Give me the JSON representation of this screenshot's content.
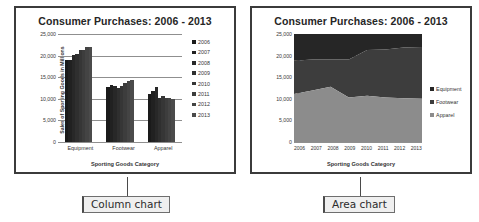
{
  "charts": [
    {
      "id": "column",
      "title": "Consumer Purchases: 2006 - 2013",
      "callout": "Column chart",
      "ylabel": "Sales of Sporting Goods  in Millions",
      "xlabel": "Sporting Goods Category"
    },
    {
      "id": "area",
      "title": "Consumer Purchases: 2006 - 2013",
      "callout": "Area chart",
      "ylabel": "Sales of Sporting Goods  in Millions",
      "xlabel": "Sporting Goods Category"
    }
  ],
  "yticks": [
    "25,000",
    "20,000",
    "15,000",
    "10,000",
    "5,000",
    "0"
  ],
  "column_legend": [
    "2006",
    "2007",
    "2008",
    "2009",
    "2010",
    "2011",
    "2012",
    "2013"
  ],
  "area_legend": [
    "Equipment",
    "Footwear",
    "Apparel"
  ],
  "categories": [
    "Equipment",
    "Footwear",
    "Apparel"
  ],
  "years": [
    "2006",
    "2007",
    "2008",
    "2009",
    "2010",
    "2011",
    "2012",
    "2013"
  ],
  "colors": {
    "equipment": "#262626",
    "footwear": "#3d3d3d",
    "apparel": "#8c8c8c",
    "border": "#3b3b3b",
    "grid": "#8f8f8f",
    "callout_bg": "#efefef"
  },
  "chart_data": [
    {
      "type": "bar",
      "title": "Consumer Purchases: 2006 - 2013",
      "xlabel": "Sporting Goods Category",
      "ylabel": "Sales of Sporting Goods  in Millions",
      "categories": [
        "Equipment",
        "Footwear",
        "Apparel"
      ],
      "ylim": [
        0,
        25000
      ],
      "yticks": [
        0,
        5000,
        10000,
        15000,
        20000,
        25000
      ],
      "grid": true,
      "legend_position": "right",
      "series": [
        {
          "name": "2006",
          "values": [
            18900,
            12700,
            11100
          ]
        },
        {
          "name": "2007",
          "values": [
            19100,
            13100,
            11900
          ]
        },
        {
          "name": "2008",
          "values": [
            20200,
            12900,
            12800
          ]
        },
        {
          "name": "2009",
          "values": [
            20400,
            12400,
            10300
          ]
        },
        {
          "name": "2010",
          "values": [
            21300,
            12900,
            10700
          ]
        },
        {
          "name": "2011",
          "values": [
            21400,
            13600,
            10300
          ]
        },
        {
          "name": "2012",
          "values": [
            21900,
            14200,
            10100
          ]
        },
        {
          "name": "2013",
          "values": [
            22000,
            14300,
            10000
          ]
        }
      ]
    },
    {
      "type": "area",
      "title": "Consumer Purchases: 2006 - 2013",
      "xlabel": "Sporting Goods Category",
      "ylabel": "Sales of Sporting Goods  in Millions",
      "stacked": true,
      "x": [
        "2006",
        "2007",
        "2008",
        "2009",
        "2010",
        "2011",
        "2012",
        "2013"
      ],
      "ylim": [
        0,
        25000
      ],
      "yticks": [
        0,
        5000,
        10000,
        15000,
        20000,
        25000
      ],
      "grid": true,
      "legend_position": "right",
      "series": [
        {
          "name": "Apparel",
          "values": [
            11100,
            11900,
            12800,
            10300,
            10700,
            10300,
            10100,
            10000
          ]
        },
        {
          "name": "Footwear",
          "values": [
            7700,
            7200,
            6300,
            8800,
            10600,
            11100,
            11800,
            12000
          ]
        },
        {
          "name": "Equipment",
          "values": [
            18900,
            19100,
            20200,
            20400,
            21300,
            21400,
            21900,
            22000
          ]
        }
      ],
      "cumulative_tops": {
        "apparel": [
          11100,
          11900,
          12800,
          10300,
          10700,
          10300,
          10100,
          10000
        ],
        "footwear": [
          18800,
          19100,
          19100,
          19100,
          21300,
          21400,
          21900,
          22000
        ],
        "equipment": [
          25000,
          25000,
          25000,
          25000,
          25000,
          25000,
          25000,
          25000
        ]
      }
    }
  ]
}
